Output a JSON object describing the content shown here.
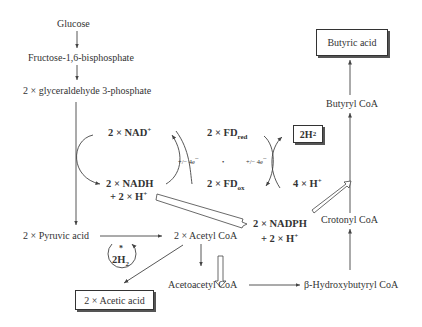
{
  "diagram": {
    "nodes": {
      "glucose": "Glucose",
      "fructose": "Fructose-1,6-bisphosphate",
      "g3p": "2 × glyceraldehyde 3-phosphate",
      "nad": "2 × NAD",
      "nad_sup": "+",
      "nadh": "2 × NADH",
      "nadh_h": "+ 2 × H",
      "nadh_h_sup": "+",
      "fd_red": "2 × FD",
      "fd_red_sub": "red",
      "fd_ox": "2 × FD",
      "fd_ox_sub": "ox",
      "h2_box": "2H",
      "h2_box_sub": "2",
      "four_h": "4 × H",
      "four_h_sup": "+",
      "electrons_left": "+/− 4e",
      "electrons_left_sup": "−",
      "electrons_right": "+/− 4e",
      "electrons_right_sup": "−",
      "dot": "•",
      "pyruvic": "2 × Pyruvic acid",
      "acetyl_coa": "2 × Acetyl CoA",
      "h2_cycle_star": "*",
      "h2_cycle": "2H",
      "h2_cycle_sub": "2",
      "acetic_acid": "2 × Acetic acid",
      "acetoacetyl": "Acetoacetyl CoA",
      "nadph": "2 × NADPH",
      "nadph_h": "+ 2 × H",
      "nadph_h_sup": "+",
      "hydroxybutyryl": "β-Hydroxybutyryl CoA",
      "crotonyl": "Crotonyl CoA",
      "butyryl": "Butyryl CoA",
      "butyric_acid": "Butyric acid"
    },
    "colors": {
      "line": "#444444",
      "text": "#333333",
      "background": "#ffffff"
    }
  }
}
